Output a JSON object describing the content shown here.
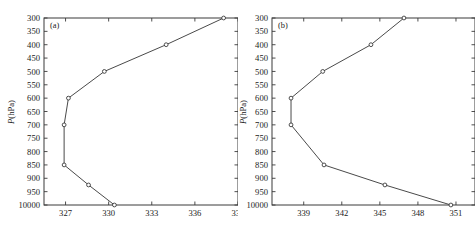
{
  "figure": {
    "width": 475,
    "height": 239,
    "background": "#ffffff",
    "line_color": "#4a4a4a",
    "axis_color": "#3a3a3a",
    "marker_fill": "#ffffff"
  },
  "chart_data": [
    {
      "type": "line",
      "panel_label": "(a)",
      "title": "",
      "xlabel": "",
      "ylabel": "P(hPa)",
      "ylabel_parts": {
        "symbol": "P",
        "unit": "(hPa)"
      },
      "xlim": [
        325.5,
        339.0
      ],
      "ylim": [
        300,
        1000
      ],
      "y_inverted": true,
      "grid": false,
      "legend": "none",
      "xticks": [
        327,
        330,
        333,
        336,
        339
      ],
      "xticklabels": [
        "327",
        "330",
        "333",
        "336",
        "339"
      ],
      "yticks": [
        300,
        350,
        400,
        450,
        500,
        550,
        600,
        650,
        700,
        750,
        800,
        850,
        900,
        950,
        1000
      ],
      "yticklabels": [
        "300",
        "350",
        "400",
        "450",
        "500",
        "550",
        "600",
        "650",
        "700",
        "750",
        "800",
        "850",
        "900",
        "950",
        "10000"
      ],
      "markers": "open-circle",
      "x": [
        330.4,
        328.6,
        326.9,
        326.9,
        327.2,
        329.7,
        334.0,
        338.0
      ],
      "y": [
        1000,
        925,
        850,
        700,
        600,
        500,
        400,
        300
      ],
      "points": [
        {
          "x": 330.4,
          "y": 1000
        },
        {
          "x": 328.6,
          "y": 925
        },
        {
          "x": 326.9,
          "y": 850
        },
        {
          "x": 326.9,
          "y": 700
        },
        {
          "x": 327.2,
          "y": 600
        },
        {
          "x": 329.7,
          "y": 500
        },
        {
          "x": 334.0,
          "y": 400
        },
        {
          "x": 338.0,
          "y": 300
        }
      ]
    },
    {
      "type": "line",
      "panel_label": "(b)",
      "title": "",
      "xlabel": "",
      "ylabel": "P(hPa)",
      "ylabel_parts": {
        "symbol": "P",
        "unit": "(hPa)"
      },
      "xlim": [
        336.5,
        352.5
      ],
      "ylim": [
        300,
        1000
      ],
      "y_inverted": true,
      "grid": false,
      "legend": "none",
      "xticks": [
        339,
        342,
        345,
        348,
        351
      ],
      "xticklabels": [
        "339",
        "342",
        "345",
        "348",
        "351"
      ],
      "yticks": [
        300,
        350,
        400,
        450,
        500,
        550,
        600,
        650,
        700,
        750,
        800,
        850,
        900,
        950,
        1000
      ],
      "yticklabels": [
        "300",
        "350",
        "400",
        "450",
        "500",
        "550",
        "600",
        "650",
        "700",
        "750",
        "800",
        "850",
        "900",
        "950",
        "10000"
      ],
      "markers": "open-circle",
      "x": [
        350.6,
        345.4,
        340.6,
        338.0,
        338.0,
        340.5,
        344.3,
        346.9
      ],
      "y": [
        1000,
        925,
        850,
        700,
        600,
        500,
        400,
        300
      ],
      "points": [
        {
          "x": 350.6,
          "y": 1000
        },
        {
          "x": 345.4,
          "y": 925
        },
        {
          "x": 340.6,
          "y": 850
        },
        {
          "x": 338.0,
          "y": 700
        },
        {
          "x": 338.0,
          "y": 600
        },
        {
          "x": 340.5,
          "y": 500
        },
        {
          "x": 344.3,
          "y": 400
        },
        {
          "x": 346.9,
          "y": 300
        }
      ]
    }
  ]
}
